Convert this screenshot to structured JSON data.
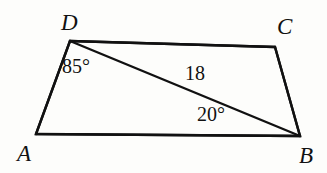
{
  "figure": {
    "kind": "quadrilateral-with-diagonal",
    "shape_name": "ABCD",
    "background_color": "#fdfdfb",
    "stroke_color": "#111111",
    "stroke_width": 2.4,
    "vertices": [
      {
        "id": "A",
        "label": "A",
        "x": 36,
        "y": 134
      },
      {
        "id": "B",
        "label": "B",
        "x": 300,
        "y": 136
      },
      {
        "id": "C",
        "label": "C",
        "x": 275,
        "y": 47
      },
      {
        "id": "D",
        "label": "D",
        "x": 70,
        "y": 41
      }
    ],
    "edges": [
      {
        "id": "AD",
        "from": "A",
        "to": "D"
      },
      {
        "id": "DC",
        "from": "D",
        "to": "C"
      },
      {
        "id": "CB",
        "from": "C",
        "to": "B"
      },
      {
        "id": "AB",
        "from": "A",
        "to": "B"
      }
    ],
    "diagonals": [
      {
        "id": "DB",
        "from": "D",
        "to": "B"
      }
    ],
    "annotations": {
      "angle_at_D": "85°",
      "angle_at_B": "20°",
      "side_DB_length": "18"
    }
  }
}
